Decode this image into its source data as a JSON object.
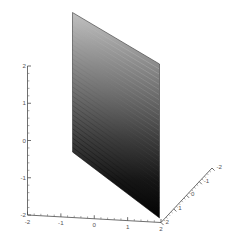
{
  "figure": {
    "title": "",
    "background_color": "#ffffff",
    "axis_color": "#4a4a4a",
    "label_color": "#555555"
  },
  "chart_data": {
    "type": "surface",
    "title": "",
    "xlabel": "",
    "ylabel": "",
    "zlabel": "",
    "projection": "3d",
    "xlim": [
      -2,
      2
    ],
    "ylim": [
      -2,
      2
    ],
    "zlim": [
      -2,
      2
    ],
    "grid": false,
    "legend": null,
    "surface": {
      "equation": "y = 0",
      "plane_orientation": "vertical",
      "mesh_rows": 30,
      "mesh_cols": 26,
      "shading": "grayscale-gradient",
      "color_top": "#b4b4b4",
      "color_mid": "#5a5a5a",
      "color_bottom": "#050505",
      "corners_3d": [
        {
          "x": -2,
          "y": 0,
          "z": 2
        },
        {
          "x": 2,
          "y": 0,
          "z": 2
        },
        {
          "x": 2,
          "y": 0,
          "z": -2
        },
        {
          "x": -2,
          "y": 0,
          "z": -2
        }
      ]
    },
    "axes": [
      {
        "name": "z-axis",
        "orientation": "vertical-left",
        "ticks": [
          2,
          1,
          0,
          -1,
          -2
        ],
        "tick_labels": [
          "2",
          "1",
          "0",
          "-1",
          "-2"
        ],
        "minor_ticks_per_interval": 4,
        "reversed": false
      },
      {
        "name": "x-axis",
        "orientation": "horizontal-bottom",
        "ticks": [
          -2,
          -1,
          0,
          1,
          2
        ],
        "tick_labels": [
          "-2",
          "-1",
          "0",
          "1",
          "2"
        ],
        "minor_ticks_per_interval": 4,
        "reversed": false
      },
      {
        "name": "y-axis",
        "orientation": "diagonal-right",
        "ticks": [
          2,
          1,
          0,
          -1,
          -2
        ],
        "tick_labels": [
          "2",
          "1",
          "0",
          "-1",
          "-2"
        ],
        "minor_ticks_per_interval": 4,
        "reversed": true
      }
    ]
  },
  "axis_labels": {
    "z": [
      "2",
      "1",
      "0",
      "-1",
      "-2"
    ],
    "x": [
      "-2",
      "-1",
      "0",
      "1",
      "2"
    ],
    "y": [
      "2",
      "1",
      "0",
      "-1",
      "-2"
    ]
  }
}
